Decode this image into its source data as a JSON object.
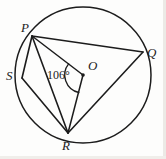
{
  "figure": {
    "shape": "circle",
    "center_label": "O",
    "angle_label": "106°",
    "angle_value": 106,
    "angle_unit": "degrees",
    "stroke_color": "#1c1c1c",
    "fill_color": "none",
    "background_color": "#fdfdfc"
  },
  "circle": {
    "center_x": 83,
    "center_y": 75,
    "radius": 68
  },
  "points": {
    "P": {
      "label": "P",
      "x": 32,
      "y": 36,
      "label_x": 21,
      "label_y": 21
    },
    "Q": {
      "label": "Q",
      "x": 143,
      "y": 52,
      "label_x": 147,
      "label_y": 46
    },
    "R": {
      "label": "R",
      "x": 68,
      "y": 133,
      "label_x": 62,
      "label_y": 139
    },
    "S": {
      "label": "S",
      "x": 22,
      "y": 78,
      "label_x": 6,
      "label_y": 69
    },
    "O": {
      "label": "O",
      "x": 83,
      "y": 75,
      "label_x": 88,
      "label_y": 59
    }
  },
  "segments": [
    {
      "name": "chord-PQ",
      "from": "P",
      "to": "Q"
    },
    {
      "name": "chord-PR",
      "from": "P",
      "to": "R"
    },
    {
      "name": "chord-PS",
      "from": "P",
      "to": "S"
    },
    {
      "name": "chord-SR",
      "from": "S",
      "to": "R"
    },
    {
      "name": "chord-RQ",
      "from": "R",
      "to": "Q"
    },
    {
      "name": "radius-OP",
      "from": "O",
      "to": "P"
    },
    {
      "name": "radius-OR",
      "from": "O",
      "to": "R"
    }
  ],
  "angle_arc": {
    "at_vertex": "O",
    "between": [
      "P",
      "R"
    ],
    "measure_label": "106°",
    "label_x": 47,
    "label_y": 69
  }
}
